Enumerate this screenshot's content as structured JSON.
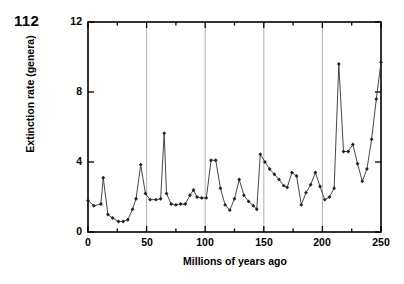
{
  "page_number": "112",
  "chart_data": {
    "type": "line",
    "title": "",
    "xlabel": "Millions of years ago",
    "ylabel": "Extinction rate (genera)",
    "xlim": [
      0,
      250
    ],
    "ylim": [
      0,
      12
    ],
    "xticks": [
      0,
      50,
      100,
      150,
      200,
      250
    ],
    "xtick_labels": [
      "0",
      "50",
      "100",
      "150",
      "200",
      "250"
    ],
    "xminor_ticks": [
      25,
      75,
      125,
      175,
      225
    ],
    "yticks": [
      0,
      4,
      8,
      12
    ],
    "ytick_labels": [
      "0",
      "4",
      "8",
      "12"
    ],
    "grid": "vertical-major",
    "gridlines_x": [
      0,
      50,
      100,
      150,
      200,
      250
    ],
    "legend": "none",
    "marker": "diamond",
    "line_color": "#333333",
    "marker_color": "#222222",
    "grid_color": "#9a9a9a",
    "axis_color": "#000000",
    "series": [
      {
        "name": "Extinction rate",
        "x": [
          0,
          5,
          11,
          13,
          17,
          21,
          26,
          30,
          34,
          38,
          41,
          45,
          49,
          53,
          58,
          62,
          65,
          67,
          71,
          75,
          79,
          83,
          87,
          90,
          93,
          97,
          101,
          105,
          109,
          113,
          117,
          121,
          125,
          129,
          133,
          137,
          141,
          144,
          147,
          151,
          155,
          159,
          163,
          167,
          170,
          174,
          178,
          182,
          186,
          190,
          194,
          198,
          202,
          206,
          210,
          214,
          218,
          222,
          226,
          230,
          234,
          238,
          242,
          246,
          250
        ],
        "y": [
          1.8,
          1.5,
          1.6,
          3.1,
          1.0,
          0.8,
          0.6,
          0.6,
          0.7,
          1.3,
          1.9,
          3.85,
          2.2,
          1.85,
          1.85,
          1.9,
          5.65,
          2.2,
          1.6,
          1.55,
          1.6,
          1.6,
          2.1,
          2.4,
          2.0,
          1.95,
          1.95,
          4.1,
          4.1,
          2.5,
          1.55,
          1.25,
          1.9,
          3.0,
          2.1,
          1.75,
          1.5,
          1.3,
          4.45,
          4.0,
          3.6,
          3.3,
          3.0,
          2.65,
          2.55,
          3.4,
          3.2,
          1.55,
          2.25,
          2.7,
          3.4,
          2.6,
          1.85,
          2.0,
          2.5,
          9.6,
          4.6,
          4.6,
          5.0,
          3.9,
          2.9,
          3.6,
          5.3,
          7.6,
          9.7
        ]
      }
    ]
  }
}
